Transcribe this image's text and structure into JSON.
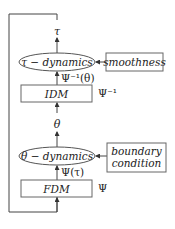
{
  "diagram": {
    "nodes": {
      "tau_dynamics": {
        "label": "τ − dynamics",
        "shape": "ellipse"
      },
      "smoothness": {
        "label": "smoothness",
        "shape": "box"
      },
      "idm": {
        "label": "IDM",
        "shape": "box",
        "side_label": "Ψ⁻¹"
      },
      "theta_dynamics": {
        "label": "θ − dynamics",
        "shape": "ellipse"
      },
      "boundary_condition": {
        "line1": "boundary",
        "line2": "condition",
        "shape": "box"
      },
      "fdm": {
        "label": "FDM",
        "shape": "box",
        "side_label": "Ψ"
      }
    },
    "edge_labels": {
      "tau": "τ",
      "psi_inv_theta": "Ψ⁻¹(θ)",
      "theta": "θ",
      "psi_tau": "Ψ(τ)"
    },
    "colors": {
      "line": "#444444",
      "text": "#222222",
      "box_fill": "#ffffff"
    }
  }
}
